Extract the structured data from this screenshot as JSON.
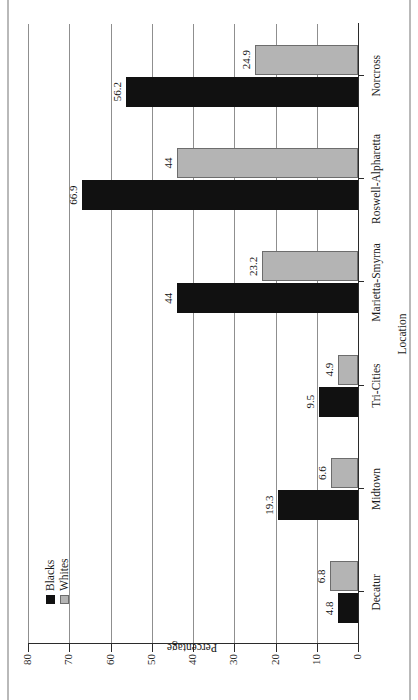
{
  "chart_data": {
    "type": "bar",
    "title": "",
    "xlabel": "Location",
    "ylabel": "Percentage",
    "categories": [
      "Decatur",
      "Midtown",
      "Tri-Cities",
      "Marietta-Smyrna",
      "Roswell-Alpharetta",
      "Norcross"
    ],
    "series": [
      {
        "name": "Blacks",
        "color": "#111111",
        "values": [
          4.8,
          19.3,
          9.5,
          44,
          66.9,
          56.2
        ]
      },
      {
        "name": "Whites",
        "color": "#b4b4b4",
        "values": [
          6.8,
          6.6,
          4.9,
          23.2,
          44,
          24.9
        ]
      }
    ],
    "value_labels": {
      "Blacks": [
        "4.8",
        "19.3",
        "9.5",
        "44",
        "66.9",
        "56.2"
      ],
      "Whites": [
        "6.8",
        "6.6",
        "4.9",
        "23.2",
        "44",
        "24.9"
      ]
    },
    "ylim": [
      0,
      80
    ],
    "yticks": [
      0,
      10,
      20,
      30,
      40,
      50,
      60,
      70,
      80
    ],
    "ytick_labels": [
      "0",
      "10",
      "20",
      "30",
      "40",
      "50",
      "60",
      "70",
      "80"
    ],
    "grid": "horizontal",
    "legend_position": "top-left",
    "orientation": "page-rotated-90-ccw"
  },
  "legend": {
    "entries": [
      {
        "label": "Blacks"
      },
      {
        "label": "Whites"
      }
    ]
  },
  "axes": {
    "y_title": "Percentage",
    "x_title": "Location"
  }
}
